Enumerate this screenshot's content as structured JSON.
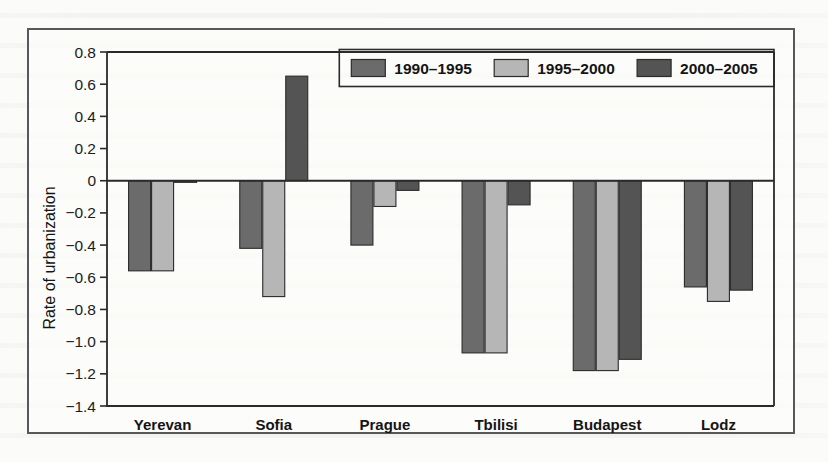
{
  "figure": {
    "frame_border_color": "#58575a",
    "background_color": "#fbfbf9"
  },
  "chart_data": {
    "type": "bar",
    "title": "",
    "subtitle": "",
    "xlabel": "",
    "ylabel": "Rate of urbanization",
    "categories": [
      "Yerevan",
      "Sofia",
      "Prague",
      "Tbilisi",
      "Budapest",
      "Lodz"
    ],
    "series": [
      {
        "name": "1990–1995",
        "color": "#6b6b6b",
        "values": [
          -0.56,
          -0.42,
          -0.4,
          -1.07,
          -1.18,
          -0.66
        ]
      },
      {
        "name": "1995–2000",
        "color": "#b6b6b6",
        "values": [
          -0.56,
          -0.72,
          -0.16,
          -1.07,
          -1.18,
          -0.75
        ]
      },
      {
        "name": "2000–2005",
        "color": "#545454",
        "values": [
          -0.01,
          0.65,
          -0.06,
          -0.15,
          -1.11,
          -0.68
        ]
      }
    ],
    "ylim": [
      -1.4,
      0.8
    ],
    "ytick_step": 0.2,
    "ytick_labels": [
      "0.8",
      "0.6",
      "0.4",
      "0.2",
      "0",
      "−0.2",
      "−0.4",
      "−0.6",
      "−0.8",
      "−1.0",
      "−1.2",
      "−1.4"
    ],
    "ytick_values": [
      0.8,
      0.6,
      0.4,
      0.2,
      0,
      -0.2,
      -0.4,
      -0.6,
      -0.8,
      -1.0,
      -1.2,
      -1.4
    ],
    "grid": false,
    "legend_position": "top-right",
    "zero_line": true
  }
}
